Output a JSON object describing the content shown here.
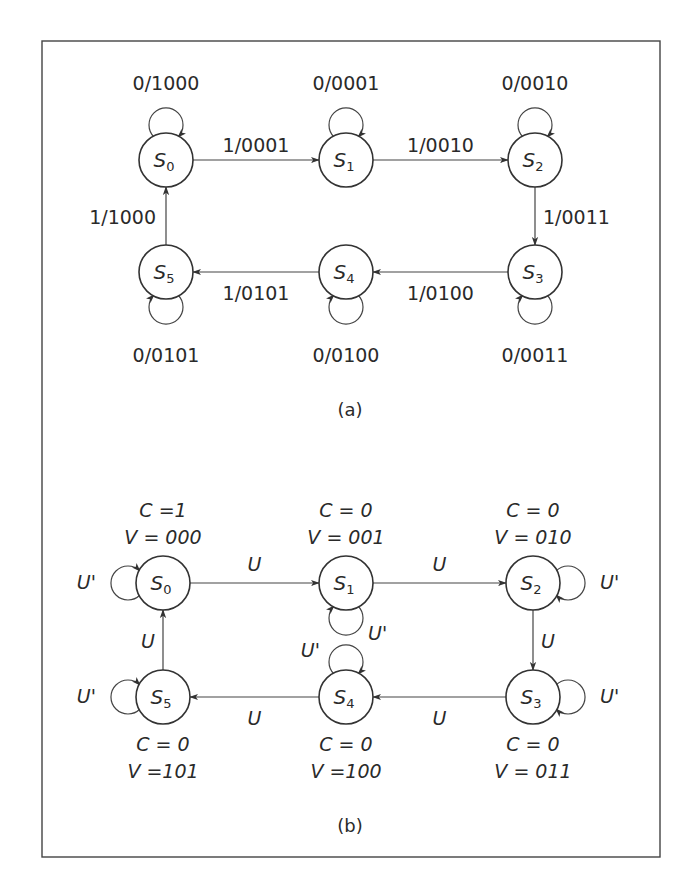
{
  "colors": {
    "stroke": "#333333",
    "text": "#2a2a2a",
    "background": "#ffffff"
  },
  "diagram_a": {
    "caption": "(a)",
    "states": [
      {
        "id": "S0",
        "base": "S",
        "sub": "0",
        "cx": 166,
        "cy": 160
      },
      {
        "id": "S1",
        "base": "S",
        "sub": "1",
        "cx": 346,
        "cy": 160
      },
      {
        "id": "S2",
        "base": "S",
        "sub": "2",
        "cx": 535,
        "cy": 160
      },
      {
        "id": "S3",
        "base": "S",
        "sub": "3",
        "cx": 535,
        "cy": 272
      },
      {
        "id": "S4",
        "base": "S",
        "sub": "4",
        "cx": 346,
        "cy": 272
      },
      {
        "id": "S5",
        "base": "S",
        "sub": "5",
        "cx": 166,
        "cy": 272
      }
    ],
    "transitions": [
      {
        "from": "S0",
        "to": "S1",
        "label": "1/0001"
      },
      {
        "from": "S1",
        "to": "S2",
        "label": "1/0010"
      },
      {
        "from": "S2",
        "to": "S3",
        "label": "1/0011"
      },
      {
        "from": "S3",
        "to": "S4",
        "label": "1/0100"
      },
      {
        "from": "S4",
        "to": "S5",
        "label": "1/0101"
      },
      {
        "from": "S5",
        "to": "S0",
        "label": "1/1000"
      }
    ],
    "self_loops": [
      {
        "state": "S0",
        "label": "0/1000",
        "side": "top"
      },
      {
        "state": "S1",
        "label": "0/0001",
        "side": "top"
      },
      {
        "state": "S2",
        "label": "0/0010",
        "side": "top"
      },
      {
        "state": "S3",
        "label": "0/0011",
        "side": "bottom"
      },
      {
        "state": "S4",
        "label": "0/0100",
        "side": "bottom"
      },
      {
        "state": "S5",
        "label": "0/0101",
        "side": "bottom"
      }
    ]
  },
  "diagram_b": {
    "caption": "(b)",
    "states": [
      {
        "id": "S0",
        "base": "S",
        "sub": "0",
        "cx": 163,
        "cy": 583,
        "C": "C =1",
        "V": "V = 000"
      },
      {
        "id": "S1",
        "base": "S",
        "sub": "1",
        "cx": 346,
        "cy": 583,
        "C": "C = 0",
        "V": "V = 001"
      },
      {
        "id": "S2",
        "base": "S",
        "sub": "2",
        "cx": 533,
        "cy": 583,
        "C": "C = 0",
        "V": "V = 010"
      },
      {
        "id": "S3",
        "base": "S",
        "sub": "3",
        "cx": 533,
        "cy": 697,
        "C": "C = 0",
        "V": "V = 011"
      },
      {
        "id": "S4",
        "base": "S",
        "sub": "4",
        "cx": 346,
        "cy": 697,
        "C": "C = 0",
        "V": "V =100"
      },
      {
        "id": "S5",
        "base": "S",
        "sub": "5",
        "cx": 163,
        "cy": 697,
        "C": "C = 0",
        "V": "V =101"
      }
    ],
    "transitions": [
      {
        "from": "S0",
        "to": "S1",
        "label": "U"
      },
      {
        "from": "S1",
        "to": "S2",
        "label": "U"
      },
      {
        "from": "S2",
        "to": "S3",
        "label": "U"
      },
      {
        "from": "S3",
        "to": "S4",
        "label": "U"
      },
      {
        "from": "S4",
        "to": "S5",
        "label": "U"
      },
      {
        "from": "S5",
        "to": "S0",
        "label": "U"
      }
    ],
    "self_loops": [
      {
        "state": "S0",
        "label": "U'",
        "side": "left"
      },
      {
        "state": "S1",
        "label": "U'",
        "side": "bottom"
      },
      {
        "state": "S2",
        "label": "U'",
        "side": "right"
      },
      {
        "state": "S3",
        "label": "U'",
        "side": "right"
      },
      {
        "state": "S4",
        "label": "U'",
        "side": "top"
      },
      {
        "state": "S5",
        "label": "U'",
        "side": "left"
      }
    ]
  }
}
